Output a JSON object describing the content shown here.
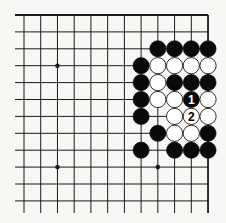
{
  "diagram": {
    "type": "go-board-fragment",
    "grid": {
      "columns": 12,
      "rows": 12,
      "origin_x": 24,
      "origin_y": 15,
      "spacing_x": 16.73,
      "spacing_y": 16.9,
      "open_left_extent": 15,
      "open_bottom_extent": 213,
      "closed_edges": [
        "top",
        "right"
      ],
      "line_color": "#1a1a1a"
    },
    "star_points": [
      {
        "col": 2,
        "row": 3
      },
      {
        "col": 2,
        "row": 9
      },
      {
        "col": 8,
        "row": 9
      }
    ],
    "stones": [
      {
        "col": 8,
        "row": 2,
        "color": "black"
      },
      {
        "col": 9,
        "row": 2,
        "color": "black"
      },
      {
        "col": 10,
        "row": 2,
        "color": "black"
      },
      {
        "col": 11,
        "row": 2,
        "color": "black"
      },
      {
        "col": 7,
        "row": 3,
        "color": "black"
      },
      {
        "col": 8,
        "row": 3,
        "color": "white"
      },
      {
        "col": 9,
        "row": 3,
        "color": "white"
      },
      {
        "col": 10,
        "row": 3,
        "color": "white"
      },
      {
        "col": 11,
        "row": 3,
        "color": "white"
      },
      {
        "col": 7,
        "row": 4,
        "color": "black"
      },
      {
        "col": 8,
        "row": 4,
        "color": "white"
      },
      {
        "col": 9,
        "row": 4,
        "color": "black"
      },
      {
        "col": 10,
        "row": 4,
        "color": "black"
      },
      {
        "col": 11,
        "row": 4,
        "color": "black"
      },
      {
        "col": 7,
        "row": 5,
        "color": "black"
      },
      {
        "col": 8,
        "row": 5,
        "color": "white"
      },
      {
        "col": 9,
        "row": 5,
        "color": "white"
      },
      {
        "col": 10,
        "row": 5,
        "color": "black",
        "label": "1"
      },
      {
        "col": 11,
        "row": 5,
        "color": "white"
      },
      {
        "col": 7,
        "row": 6,
        "color": "black"
      },
      {
        "col": 9,
        "row": 6,
        "color": "white"
      },
      {
        "col": 10,
        "row": 6,
        "color": "white",
        "label": "2"
      },
      {
        "col": 11,
        "row": 6,
        "color": "white"
      },
      {
        "col": 8,
        "row": 7,
        "color": "black"
      },
      {
        "col": 9,
        "row": 7,
        "color": "white"
      },
      {
        "col": 10,
        "row": 7,
        "color": "white"
      },
      {
        "col": 11,
        "row": 7,
        "color": "black"
      },
      {
        "col": 7,
        "row": 8,
        "color": "black"
      },
      {
        "col": 9,
        "row": 8,
        "color": "black"
      },
      {
        "col": 10,
        "row": 8,
        "color": "black"
      },
      {
        "col": 11,
        "row": 8,
        "color": "black"
      }
    ],
    "colors": {
      "background": "#f7f7f5",
      "black_stone": "#0a0a0a",
      "white_stone": "#ffffff",
      "white_stone_border": "#1a1a1a"
    }
  }
}
